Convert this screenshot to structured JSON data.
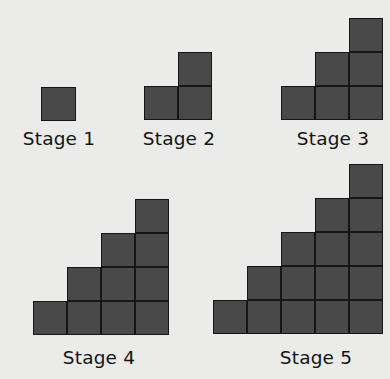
{
  "figure": {
    "colors": {
      "background": "#ebebea",
      "square_fill": "#494949",
      "square_border": "#161616",
      "text": "#141414"
    },
    "stages": [
      {
        "label": "Stage 1",
        "n": 1,
        "squares": 1
      },
      {
        "label": "Stage 2",
        "n": 2,
        "squares": 3
      },
      {
        "label": "Stage 3",
        "n": 3,
        "squares": 6
      },
      {
        "label": "Stage 4",
        "n": 4,
        "squares": 10
      },
      {
        "label": "Stage 5",
        "n": 5,
        "squares": 15
      }
    ]
  }
}
